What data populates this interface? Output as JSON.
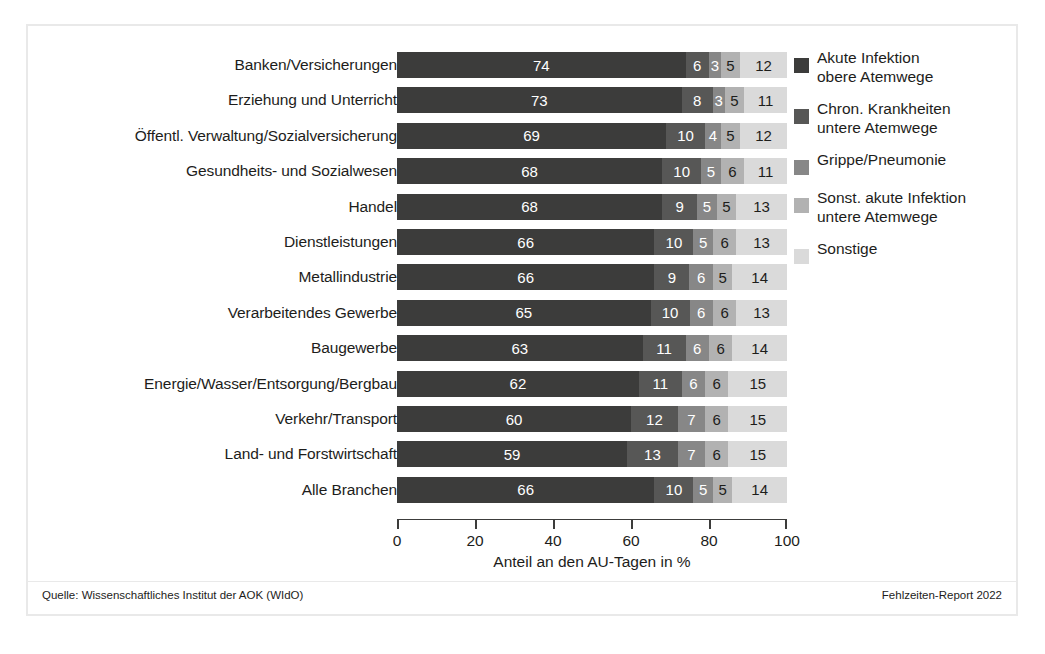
{
  "chart_data": {
    "type": "bar",
    "orientation": "horizontal",
    "stacked": true,
    "normalized_percent": true,
    "title": "",
    "xlabel": "Anteil an den AU-Tagen in %",
    "ylabel": "",
    "xlim": [
      0,
      100
    ],
    "xticks": [
      0,
      20,
      40,
      60,
      80,
      100
    ],
    "grid": false,
    "legend_position": "right",
    "categories": [
      "Banken/Versicherungen",
      "Erziehung und Unterricht",
      "Öffentl. Verwaltung/Sozialversicherung",
      "Gesundheits- und Sozialwesen",
      "Handel",
      "Dienstleistungen",
      "Metallindustrie",
      "Verarbeitendes Gewerbe",
      "Baugewerbe",
      "Energie/Wasser/Entsorgung/Bergbau",
      "Verkehr/Transport",
      "Land- und Forstwirtschaft",
      "Alle Branchen"
    ],
    "series": [
      {
        "name": "Akute Infektion obere Atemwege",
        "color": "#3c3c3b",
        "values": [
          74,
          73,
          69,
          68,
          68,
          66,
          66,
          65,
          63,
          62,
          60,
          59,
          66
        ]
      },
      {
        "name": "Chron. Krankheiten untere Atemwege",
        "color": "#575756",
        "values": [
          6,
          8,
          10,
          10,
          9,
          10,
          9,
          10,
          11,
          11,
          12,
          13,
          10
        ]
      },
      {
        "name": "Grippe/Pneumonie",
        "color": "#878787",
        "values": [
          3,
          3,
          4,
          5,
          5,
          5,
          6,
          6,
          6,
          6,
          7,
          7,
          5
        ]
      },
      {
        "name": "Sonst. akute Infektion untere Atemwege",
        "color": "#b2b2b2",
        "values": [
          5,
          5,
          5,
          6,
          5,
          6,
          5,
          6,
          6,
          6,
          6,
          6,
          5
        ]
      },
      {
        "name": "Sonstige",
        "color": "#dadada",
        "values": [
          12,
          11,
          12,
          11,
          13,
          13,
          14,
          13,
          14,
          15,
          15,
          15,
          14
        ]
      }
    ]
  },
  "legend": {
    "items": [
      {
        "label": "Akute Infektion\nobere Atemwege",
        "color": "#3c3c3b"
      },
      {
        "label": "Chron. Krankheiten\nuntere Atemwege",
        "color": "#575756"
      },
      {
        "label": "Grippe/Pneumonie",
        "color": "#878787"
      },
      {
        "label": "Sonst. akute Infektion\nuntere Atemwege",
        "color": "#b2b2b2"
      },
      {
        "label": "Sonstige",
        "color": "#dadada"
      }
    ]
  },
  "axis": {
    "title": "Anteil an den AU-Tagen in %",
    "tick_labels": [
      "0",
      "20",
      "40",
      "60",
      "80",
      "100"
    ]
  },
  "footer": {
    "source": "Quelle: Wissenschaftliches Institut der AOK (WIdO)",
    "report": "Fehlzeiten-Report 2022"
  }
}
